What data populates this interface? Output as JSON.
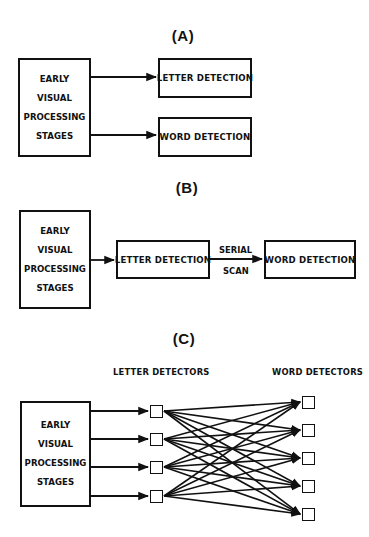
{
  "panels": {
    "a": {
      "title": "(A)",
      "source": {
        "lines": [
          "EARLY",
          "VISUAL",
          "PROCESSING",
          "STAGES"
        ]
      },
      "targets": [
        "LETTER DETECTION",
        "WORD DETECTION"
      ]
    },
    "b": {
      "title": "(B)",
      "source": {
        "lines": [
          "EARLY",
          "VISUAL",
          "PROCESSING",
          "STAGES"
        ]
      },
      "middle": "LETTER DETECTION",
      "edge_label": {
        "top": "SERIAL",
        "bottom": "SCAN"
      },
      "target": "WORD DETECTION"
    },
    "c": {
      "title": "(C)",
      "source": {
        "lines": [
          "EARLY",
          "VISUAL",
          "PROCESSING",
          "STAGES"
        ]
      },
      "letter_label": "LETTER DETECTORS",
      "word_label": "WORD DETECTORS",
      "letter_detector_count": 4,
      "word_detector_count": 5,
      "connectivity": "all letter detectors connected to all word detectors"
    }
  },
  "colors": {
    "ink": "#111111",
    "background": "#ffffff"
  }
}
